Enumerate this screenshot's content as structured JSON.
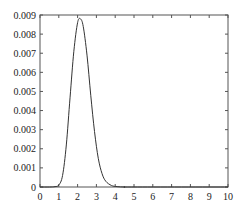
{
  "chart_data": {
    "type": "line",
    "title": "",
    "xlabel": "",
    "ylabel": "",
    "xlim": [
      0,
      10
    ],
    "ylim": [
      0,
      0.009
    ],
    "grid": false,
    "legend": null,
    "x_ticks": [
      "0",
      "1",
      "2",
      "3",
      "4",
      "5",
      "6",
      "7",
      "8",
      "9",
      "10"
    ],
    "y_ticks": [
      "0",
      "0.001",
      "0.002",
      "0.003",
      "0.004",
      "0.005",
      "0.006",
      "0.007",
      "0.008",
      "0.009"
    ],
    "series": [
      {
        "name": "density",
        "color": "#333333",
        "x": [
          0,
          0.5,
          0.8,
          1.0,
          1.2,
          1.4,
          1.6,
          1.8,
          2.0,
          2.15,
          2.3,
          2.5,
          2.7,
          2.9,
          3.1,
          3.3,
          3.5,
          3.8,
          4.1,
          4.5,
          5,
          10
        ],
        "y": [
          0,
          0,
          2e-05,
          0.0001,
          0.0006,
          0.0022,
          0.0047,
          0.0071,
          0.0086,
          0.0088,
          0.0084,
          0.0069,
          0.0048,
          0.0029,
          0.0015,
          0.0007,
          0.0003,
          8e-05,
          2e-05,
          0,
          0,
          0
        ]
      }
    ]
  }
}
